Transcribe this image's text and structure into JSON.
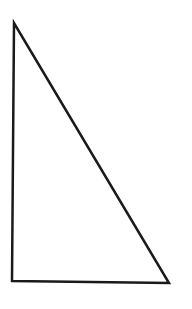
{
  "diagram": {
    "shape": "right-triangle",
    "stroke_color": "#1a1a1a",
    "fill_color": "none",
    "stroke_width": 2.5,
    "vertices": {
      "top": {
        "x": 14,
        "y": 23
      },
      "bottom_left": {
        "x": 12,
        "y": 281
      },
      "bottom_right": {
        "x": 169,
        "y": 283
      }
    }
  }
}
